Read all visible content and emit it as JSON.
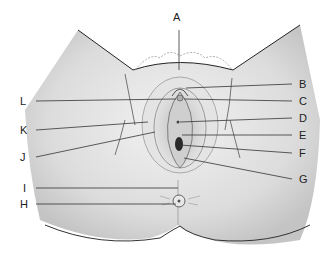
{
  "diagram": {
    "type": "anatomical-illustration",
    "labels": [
      {
        "letter": "A",
        "x": 173,
        "y": 17
      },
      {
        "letter": "B",
        "x": 300,
        "y": 79
      },
      {
        "letter": "C",
        "x": 300,
        "y": 96
      },
      {
        "letter": "D",
        "x": 300,
        "y": 114
      },
      {
        "letter": "E",
        "x": 300,
        "y": 131
      },
      {
        "letter": "F",
        "x": 300,
        "y": 148
      },
      {
        "letter": "G",
        "x": 300,
        "y": 174
      },
      {
        "letter": "H",
        "x": 22,
        "y": 199
      },
      {
        "letter": "I",
        "x": 24,
        "y": 183
      },
      {
        "letter": "J",
        "x": 22,
        "y": 152
      },
      {
        "letter": "K",
        "x": 22,
        "y": 125
      },
      {
        "letter": "L",
        "x": 22,
        "y": 97
      }
    ]
  }
}
